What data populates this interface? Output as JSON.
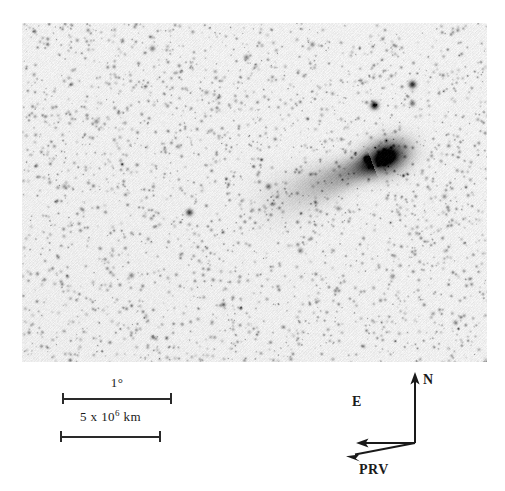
{
  "figure": {
    "kind": "comet-photograph",
    "plate": {
      "left": 22,
      "top": 23,
      "width": 465,
      "height": 339,
      "background_color": "#f3f3f3",
      "ink_color": "#1a1a1a",
      "rendering": "photographic negative (dark features on light sky)"
    }
  },
  "scalebars": [
    {
      "name": "angular-scale",
      "label_text": "1",
      "label_unit": "°",
      "label_full": "1°",
      "length_px": 110
    },
    {
      "name": "linear-scale",
      "label_prefix": "5 x 10",
      "label_exponent": "6",
      "label_suffix": " km",
      "label_full": "5 x 10⁶ km",
      "length_px": 101
    }
  ],
  "compass": {
    "north_label": "N",
    "east_label": "E",
    "prv_label": "PRV",
    "origin": {
      "x": 85,
      "y": 79
    },
    "arrows": [
      {
        "name": "north-arrow",
        "direction": "up",
        "tip": {
          "x": 85,
          "y": 11
        }
      },
      {
        "name": "east-arrow",
        "direction": "left",
        "tip": {
          "x": 28,
          "y": 79
        }
      },
      {
        "name": "prv-arrow",
        "direction": "down-left",
        "tip": {
          "x": 17,
          "y": 92
        }
      }
    ]
  },
  "chart_data": {
    "type": "scatter",
    "title": "",
    "xlabel": "",
    "ylabel": "",
    "comet": {
      "coma_center": {
        "x": 385,
        "y": 157
      },
      "coma_radius_px": 20,
      "tail_start": {
        "x": 372,
        "y": 163
      },
      "tail_end": {
        "x": 238,
        "y": 216
      },
      "tail_position_angle_deg": 201,
      "peak_darkness": 0.96
    },
    "stars": [
      {
        "x": 374,
        "y": 105,
        "mag": 0.8
      },
      {
        "x": 412,
        "y": 84,
        "mag": 0.72
      },
      {
        "x": 412,
        "y": 103,
        "mag": 0.45
      },
      {
        "x": 366,
        "y": 158,
        "mag": 0.55
      },
      {
        "x": 189,
        "y": 212,
        "mag": 0.62
      },
      {
        "x": 152,
        "y": 48,
        "mag": 0.4
      },
      {
        "x": 246,
        "y": 57,
        "mag": 0.38
      },
      {
        "x": 312,
        "y": 44,
        "mag": 0.34
      },
      {
        "x": 96,
        "y": 121,
        "mag": 0.33
      },
      {
        "x": 64,
        "y": 186,
        "mag": 0.3
      },
      {
        "x": 131,
        "y": 275,
        "mag": 0.36
      },
      {
        "x": 223,
        "y": 304,
        "mag": 0.32
      },
      {
        "x": 300,
        "y": 250,
        "mag": 0.35
      },
      {
        "x": 392,
        "y": 276,
        "mag": 0.33
      },
      {
        "x": 444,
        "y": 196,
        "mag": 0.31
      },
      {
        "x": 455,
        "y": 322,
        "mag": 0.29
      },
      {
        "x": 178,
        "y": 146,
        "mag": 0.28
      },
      {
        "x": 268,
        "y": 186,
        "mag": 0.42
      },
      {
        "x": 338,
        "y": 208,
        "mag": 0.3
      },
      {
        "x": 206,
        "y": 92,
        "mag": 0.27
      }
    ],
    "sky_background_level": 0.94,
    "noise_amplitude": 0.05
  }
}
